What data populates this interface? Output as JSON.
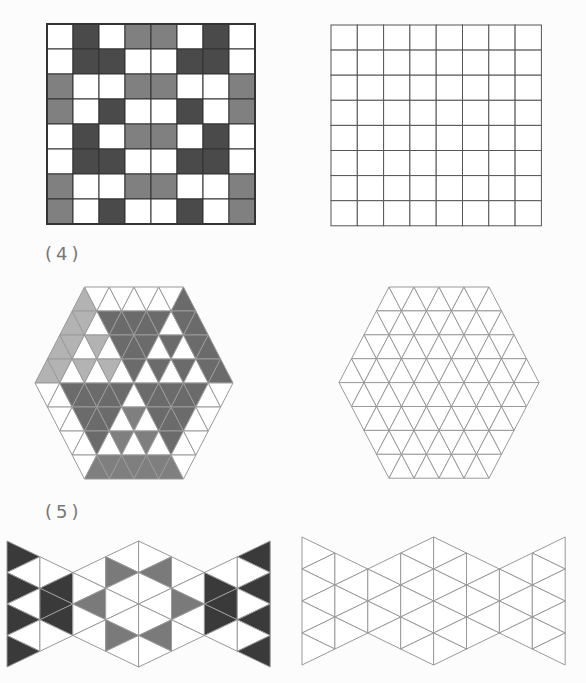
{
  "colors": {
    "white": "#ffffff",
    "square_dark": "#4a4a4a",
    "square_gray": "#808080",
    "square_border": "#333333",
    "hex_light": "#b3b3b3",
    "hex_dark": "#6b6b6b",
    "hex_mid": "#7f7f7f",
    "hex_line": "#9a9a9a",
    "bow_dark": "#3a3a3a",
    "bow_gray": "#7a7a7a",
    "bow_line": "#999999"
  },
  "labels": {
    "problem4": "(4)",
    "problem5": "(5)"
  },
  "square_puzzle": {
    "rows": 8,
    "cols": 8,
    "pattern": [
      [
        "W",
        "D",
        "W",
        "G",
        "G",
        "W",
        "D",
        "W"
      ],
      [
        "W",
        "D",
        "D",
        "W",
        "W",
        "D",
        "D",
        "W"
      ],
      [
        "G",
        "W",
        "W",
        "G",
        "G",
        "W",
        "W",
        "G"
      ],
      [
        "G",
        "W",
        "D",
        "W",
        "W",
        "D",
        "W",
        "G"
      ],
      [
        "W",
        "D",
        "W",
        "G",
        "G",
        "W",
        "D",
        "W"
      ],
      [
        "W",
        "D",
        "D",
        "W",
        "W",
        "D",
        "D",
        "W"
      ],
      [
        "G",
        "W",
        "W",
        "G",
        "G",
        "W",
        "W",
        "G"
      ],
      [
        "G",
        "W",
        "D",
        "W",
        "W",
        "D",
        "W",
        "G"
      ]
    ],
    "blank_rows": 8,
    "blank_cols": 8
  },
  "hex_puzzle": {
    "side": 4,
    "rows": [
      [
        "L",
        "W",
        "W",
        "W",
        "W",
        "W",
        "W",
        "W",
        "D"
      ],
      [
        "L",
        "L",
        "W",
        "D",
        "D",
        "D",
        "D",
        "D",
        "W",
        "D",
        "D"
      ],
      [
        "L",
        "L",
        "W",
        "L",
        "W",
        "D",
        "D",
        "D",
        "W",
        "D",
        "W",
        "D",
        "D"
      ],
      [
        "L",
        "L",
        "W",
        "L",
        "W",
        "L",
        "W",
        "D",
        "W",
        "D",
        "W",
        "D",
        "W",
        "D",
        "D"
      ],
      [
        "W",
        "W",
        "D",
        "D",
        "D",
        "D",
        "D",
        "W",
        "D",
        "D",
        "D",
        "D",
        "D",
        "W",
        "W"
      ],
      [
        "W",
        "W",
        "D",
        "D",
        "D",
        "W",
        "M",
        "W",
        "D",
        "D",
        "D",
        "W",
        "W"
      ],
      [
        "W",
        "W",
        "D",
        "W",
        "M",
        "W",
        "M",
        "W",
        "D",
        "W",
        "W"
      ],
      [
        "W",
        "M",
        "M",
        "M",
        "M",
        "M",
        "M",
        "M",
        "W"
      ]
    ]
  },
  "bowtie_puzzle": {
    "columns": 8,
    "pattern": [
      [
        "D",
        "W",
        "D",
        "W",
        "D",
        "W",
        "D"
      ],
      [
        "W",
        "D",
        "D",
        "D",
        "W"
      ],
      [
        "W",
        "W",
        "G",
        "W",
        "W"
      ],
      [
        "W",
        "G",
        "W",
        "W",
        "W",
        "G",
        "W"
      ],
      [
        "W",
        "G",
        "W",
        "W",
        "W",
        "G",
        "W"
      ],
      [
        "W",
        "W",
        "G",
        "W",
        "W"
      ],
      [
        "W",
        "D",
        "D",
        "D",
        "W"
      ],
      [
        "D",
        "W",
        "D",
        "W",
        "D",
        "W",
        "D"
      ]
    ]
  }
}
